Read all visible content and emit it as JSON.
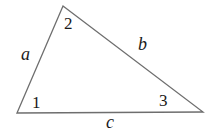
{
  "diagram": {
    "type": "triangle",
    "stroke_color": "#6e6e6e",
    "text_color": "#1a1a1a",
    "vertices": [
      {
        "id": "1",
        "x": 17,
        "y": 113
      },
      {
        "id": "2",
        "x": 63,
        "y": 6
      },
      {
        "id": "3",
        "x": 203,
        "y": 112
      }
    ],
    "angle_labels": [
      {
        "text": "1",
        "x": 32,
        "y": 108
      },
      {
        "text": "2",
        "x": 64,
        "y": 29
      },
      {
        "text": "3",
        "x": 159,
        "y": 106
      }
    ],
    "side_labels": [
      {
        "text": "a",
        "side": "1-2",
        "x": 21,
        "y": 60
      },
      {
        "text": "b",
        "side": "2-3",
        "x": 138,
        "y": 50
      },
      {
        "text": "c",
        "side": "1-3",
        "x": 106,
        "y": 128
      }
    ]
  }
}
